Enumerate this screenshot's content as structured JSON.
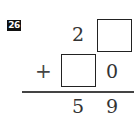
{
  "problem": {
    "number": "26",
    "operator": "+",
    "row1": {
      "tens": "2",
      "ones": ""
    },
    "row2": {
      "tens": "",
      "ones": "0"
    },
    "result": {
      "tens": "5",
      "ones": "9"
    }
  }
}
